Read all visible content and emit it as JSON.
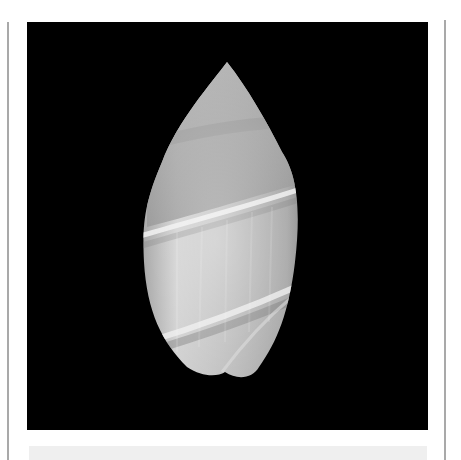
{
  "figure": {
    "background_color": "#000000",
    "page_color": "#ffffff",
    "rule_color": "#a9a9a9",
    "strip_color": "#efefef",
    "shell_colors": {
      "light": "#e4e4e4",
      "mid": "#b4b4b4",
      "dark": "#6e6e6e",
      "band": "#f2f2f2"
    }
  }
}
